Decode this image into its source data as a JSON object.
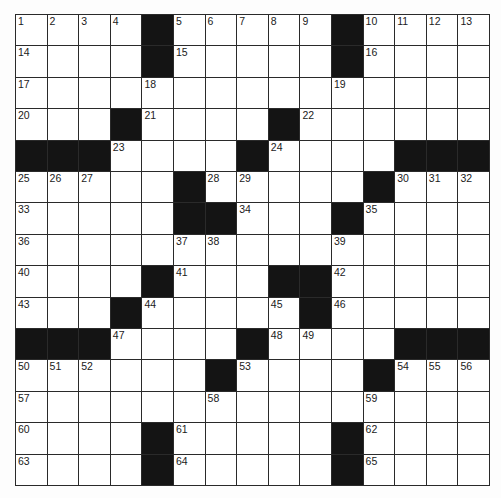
{
  "puzzle": {
    "rows": 15,
    "cols": 15,
    "colors": {
      "block": "#141414",
      "cell": "#ffffff",
      "line": "#2a2a2a"
    },
    "grid": [
      ".... ..... ....",
      ".... ..... ....",
      "...............",
      "... .... ......",
      "    ... ....   ",
      "..... ..... ...",
      ".....  ... ....",
      "...............",
      ".... ...  .....",
      "... .... . .....",
      "    ... ....   ",
      "...... .... ...",
      "...............",
      ".... ..... ....",
      ".... ..... ...."
    ],
    "numbers": [
      [
        1,
        2,
        3,
        4,
        0,
        5,
        6,
        7,
        8,
        9,
        0,
        10,
        11,
        12,
        13
      ],
      [
        14,
        0,
        0,
        0,
        0,
        15,
        0,
        0,
        0,
        0,
        0,
        16,
        0,
        0,
        0
      ],
      [
        17,
        0,
        0,
        0,
        18,
        0,
        0,
        0,
        0,
        0,
        19,
        0,
        0,
        0,
        0
      ],
      [
        20,
        0,
        0,
        0,
        21,
        0,
        0,
        0,
        0,
        22,
        0,
        0,
        0,
        0,
        0
      ],
      [
        0,
        0,
        0,
        23,
        0,
        0,
        0,
        0,
        24,
        0,
        0,
        0,
        0,
        0,
        0
      ],
      [
        25,
        26,
        27,
        0,
        0,
        0,
        28,
        29,
        0,
        0,
        0,
        0,
        30,
        31,
        32
      ],
      [
        33,
        0,
        0,
        0,
        0,
        0,
        0,
        34,
        0,
        0,
        0,
        35,
        0,
        0,
        0
      ],
      [
        36,
        0,
        0,
        0,
        0,
        37,
        38,
        0,
        0,
        0,
        39,
        0,
        0,
        0,
        0
      ],
      [
        40,
        0,
        0,
        0,
        0,
        41,
        0,
        0,
        0,
        0,
        42,
        0,
        0,
        0,
        0
      ],
      [
        43,
        0,
        0,
        0,
        44,
        0,
        0,
        0,
        45,
        0,
        46,
        0,
        0,
        0,
        0
      ],
      [
        0,
        0,
        0,
        47,
        0,
        0,
        0,
        0,
        48,
        49,
        0,
        0,
        0,
        0,
        0
      ],
      [
        50,
        51,
        52,
        0,
        0,
        0,
        0,
        53,
        0,
        0,
        0,
        0,
        54,
        55,
        56
      ],
      [
        57,
        0,
        0,
        0,
        0,
        0,
        58,
        0,
        0,
        0,
        0,
        59,
        0,
        0,
        0
      ],
      [
        60,
        0,
        0,
        0,
        0,
        61,
        0,
        0,
        0,
        0,
        0,
        62,
        0,
        0,
        0
      ],
      [
        63,
        0,
        0,
        0,
        0,
        64,
        0,
        0,
        0,
        0,
        0,
        65,
        0,
        0,
        0
      ]
    ],
    "blocks": [
      [
        0,
        4
      ],
      [
        0,
        10
      ],
      [
        1,
        4
      ],
      [
        1,
        10
      ],
      [
        3,
        3
      ],
      [
        3,
        8
      ],
      [
        4,
        0
      ],
      [
        4,
        1
      ],
      [
        4,
        2
      ],
      [
        4,
        7
      ],
      [
        4,
        12
      ],
      [
        4,
        13
      ],
      [
        4,
        14
      ],
      [
        5,
        5
      ],
      [
        5,
        11
      ],
      [
        6,
        5
      ],
      [
        6,
        6
      ],
      [
        6,
        10
      ],
      [
        8,
        4
      ],
      [
        8,
        8
      ],
      [
        8,
        9
      ],
      [
        9,
        3
      ],
      [
        9,
        9
      ],
      [
        10,
        0
      ],
      [
        10,
        1
      ],
      [
        10,
        2
      ],
      [
        10,
        7
      ],
      [
        10,
        12
      ],
      [
        10,
        13
      ],
      [
        10,
        14
      ],
      [
        11,
        6
      ],
      [
        11,
        11
      ],
      [
        13,
        4
      ],
      [
        13,
        10
      ],
      [
        14,
        4
      ],
      [
        14,
        10
      ]
    ]
  }
}
